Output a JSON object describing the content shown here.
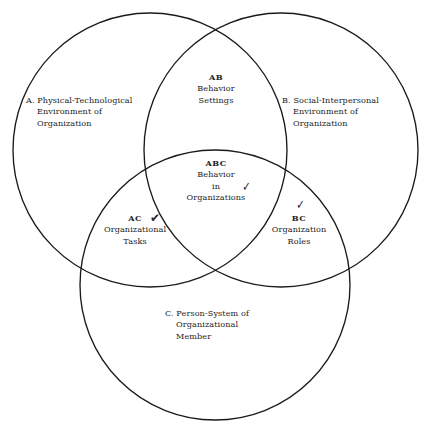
{
  "diagram": {
    "type": "venn-3-circle",
    "background_color": "#ffffff",
    "stroke_color": "#1a1a1a",
    "text_color": "#232323",
    "circles": [
      {
        "id": "A",
        "cx": 150,
        "cy": 150,
        "r": 137
      },
      {
        "id": "B",
        "cx": 281,
        "cy": 150,
        "r": 137
      },
      {
        "id": "C",
        "cx": 215,
        "cy": 285,
        "r": 135
      }
    ],
    "regions": {
      "a_only": {
        "code": "A.",
        "lines": [
          "A.  Physical-Technological",
          "Environment of",
          "Organization"
        ],
        "line1": "A.  Physical-Technological",
        "line2": "Environment of",
        "line3": "Organization"
      },
      "b_only": {
        "code": "B.",
        "lines": [
          "B.  Social-Interpersonal",
          "Environment of",
          "Organization"
        ],
        "line1": "B.  Social-Interpersonal",
        "line2": "Environment of",
        "line3": "Organization"
      },
      "c_only": {
        "code": "C.",
        "lines": [
          "C.  Person-System of",
          "Organizational",
          "Member"
        ],
        "line1": "C.  Person-System of",
        "line2": "Organizational",
        "line3": "Member"
      },
      "ab": {
        "code": "AB",
        "line1": "Behavior",
        "line2": "Settings"
      },
      "ac": {
        "code": "AC",
        "line1": "Organizational",
        "line2": "Tasks",
        "check": "✔"
      },
      "bc": {
        "code": "BC",
        "line1": "Organization",
        "line2": "Roles",
        "check": "✓"
      },
      "abc": {
        "code": "ABC",
        "line1": "Behavior",
        "line2": "in",
        "line3": "Organizations",
        "check": "✓"
      }
    }
  }
}
